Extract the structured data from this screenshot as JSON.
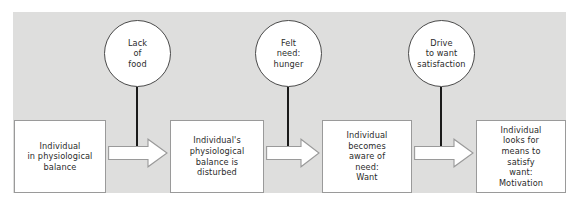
{
  "diagram": {
    "panel_color": "#dededd",
    "page_background": "#ffffff",
    "circle_stroke": "#4a4a4a",
    "box_stroke": "#9a9a9a",
    "connector_color": "#1a1a1a",
    "arrow_fill": "#ffffff",
    "arrow_stroke": "#9a9a9a",
    "circles": [
      {
        "id": "lack-of-food",
        "label": "Lack\nof\nfood",
        "cx": 137,
        "cy": 53
      },
      {
        "id": "felt-need-hunger",
        "label": "Felt\nneed:\nhunger",
        "cx": 288,
        "cy": 53
      },
      {
        "id": "drive-to-want",
        "label": "Drive\nto want\nsatisfaction",
        "cx": 441,
        "cy": 53
      }
    ],
    "boxes": [
      {
        "id": "physiological-balance",
        "label": "Individual\nin physiological\nbalance",
        "x": 14,
        "y": 120,
        "w": 92,
        "h": 73
      },
      {
        "id": "balance-disturbed",
        "label": "Individual's\nphysiological\nbalance is\ndisturbed",
        "x": 170,
        "y": 120,
        "w": 94,
        "h": 73
      },
      {
        "id": "aware-of-need-want",
        "label": "Individual\nbecomes\naware of\nneed:\nWant",
        "x": 322,
        "y": 120,
        "w": 90,
        "h": 73
      },
      {
        "id": "looks-for-means",
        "label": "Individual\nlooks for\nmeans to\nsatisfy\nwant:\nMotivation",
        "x": 476,
        "y": 120,
        "w": 90,
        "h": 73
      }
    ],
    "arrows": [
      {
        "id": "arrow-1",
        "x": 108,
        "y": 138,
        "w": 60,
        "h": 30
      },
      {
        "id": "arrow-2",
        "x": 266,
        "y": 138,
        "w": 54,
        "h": 30
      },
      {
        "id": "arrow-3",
        "x": 414,
        "y": 138,
        "w": 60,
        "h": 30
      }
    ],
    "connectors": [
      {
        "id": "connector-1",
        "x": 137,
        "top": 90,
        "bottom": 153
      },
      {
        "id": "connector-2",
        "x": 288,
        "top": 90,
        "bottom": 153
      },
      {
        "id": "connector-3",
        "x": 441,
        "top": 90,
        "bottom": 153
      }
    ]
  }
}
